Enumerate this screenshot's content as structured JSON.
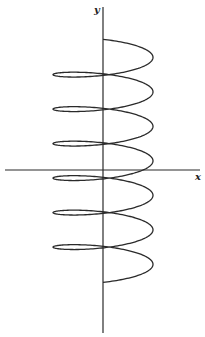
{
  "figure": {
    "axes": {
      "x_label": "x",
      "y_label": "y",
      "origin_px": [
        103,
        170
      ],
      "x_axis_px": {
        "from": 5,
        "to": 200,
        "y": 170
      },
      "y_axis_px": {
        "x": 103,
        "from": 7,
        "to": 333
      }
    },
    "curve": {
      "type": "helix",
      "turns": 6.5,
      "start_px": [
        103,
        40
      ],
      "end_px": [
        103,
        282
      ],
      "horizontal_radius_px": 50,
      "vertical_ellipse_radius_px": 9.4,
      "pitch_px": 34.5,
      "line_color": "#2a2a2a"
    }
  },
  "chart_data": {
    "type": "line",
    "title": "",
    "xlabel": "x",
    "ylabel": "y",
    "grid": false,
    "legend": "none",
    "parametric": {
      "x": "x0 - R*sin(t)",
      "y": "y0 + k*t + r*cos(t)",
      "x0": 103,
      "y0": 66,
      "R": 50,
      "k": 5.49,
      "r": 9.4,
      "t_range": [
        -3.1416,
        37.699
      ]
    },
    "axis_crossings_back_y_px": [
      74,
      108,
      142,
      176,
      211,
      245
    ],
    "axis_crossings_front_y_px": [
      110,
      144,
      178,
      212,
      247,
      282
    ]
  }
}
